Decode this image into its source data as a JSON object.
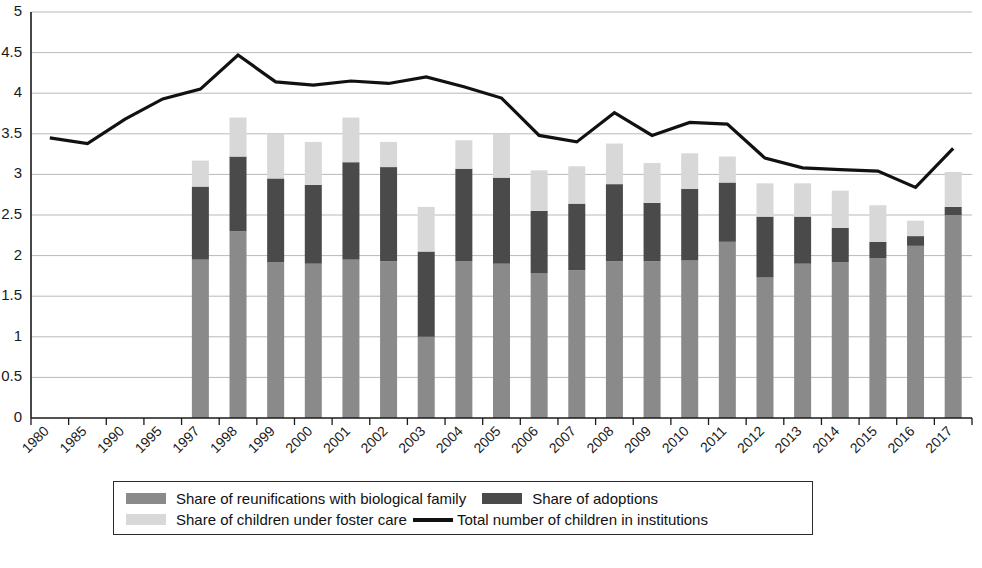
{
  "chart_data": {
    "type": "bar",
    "title": "",
    "subtitle": "",
    "xlabel": "",
    "ylabel": "",
    "ylim": [
      0,
      5
    ],
    "ytick_values": [
      0,
      0.5,
      1,
      1.5,
      2,
      2.5,
      3,
      3.5,
      4,
      4.5,
      5
    ],
    "ytick_labels": [
      "0",
      "0.5",
      "1",
      "1.5",
      "2",
      "2.5",
      "3",
      "3.5",
      "4",
      "4.5",
      "5"
    ],
    "grid": true,
    "stacked": true,
    "legend_position": "bottom",
    "categories": [
      "1980",
      "1985",
      "1990",
      "1995",
      "1997",
      "1998",
      "1999",
      "2000",
      "2001",
      "2002",
      "2003",
      "2004",
      "2005",
      "2006",
      "2007",
      "2008",
      "2009",
      "2010",
      "2011",
      "2012",
      "2013",
      "2014",
      "2015",
      "2016",
      "2017"
    ],
    "series": [
      {
        "name": "Share of reunifications with biological family",
        "color": "#8a8a8a",
        "type": "bar",
        "values": [
          null,
          null,
          null,
          null,
          1.95,
          2.3,
          1.92,
          1.9,
          1.95,
          1.93,
          1.0,
          1.93,
          1.9,
          1.78,
          1.82,
          1.93,
          1.93,
          1.94,
          2.17,
          1.73,
          1.9,
          1.92,
          1.97,
          2.12,
          2.5
        ]
      },
      {
        "name": "Share of adoptions",
        "color": "#4a4a4a",
        "type": "bar",
        "values": [
          null,
          null,
          null,
          null,
          0.9,
          0.92,
          1.03,
          0.97,
          1.2,
          1.16,
          1.05,
          1.14,
          1.06,
          0.77,
          0.82,
          0.95,
          0.72,
          0.88,
          0.73,
          0.75,
          0.58,
          0.42,
          0.2,
          0.12,
          0.1
        ]
      },
      {
        "name": "Share of children under foster care",
        "color": "#d8d8d8",
        "type": "bar",
        "values": [
          null,
          null,
          null,
          null,
          0.32,
          0.48,
          0.55,
          0.53,
          0.55,
          0.31,
          0.55,
          0.35,
          0.54,
          0.5,
          0.46,
          0.5,
          0.49,
          0.44,
          0.32,
          0.41,
          0.41,
          0.46,
          0.45,
          0.19,
          0.43
        ]
      },
      {
        "name": "Total number of children in institutions",
        "color": "#111111",
        "type": "line",
        "values": [
          3.45,
          3.38,
          3.68,
          3.93,
          4.05,
          4.47,
          4.14,
          4.1,
          4.15,
          4.12,
          4.2,
          4.08,
          3.94,
          3.48,
          3.4,
          3.76,
          3.48,
          3.64,
          3.62,
          3.2,
          3.08,
          3.06,
          3.04,
          2.84,
          3.32
        ]
      }
    ]
  },
  "legend": {
    "items": [
      {
        "label": "Share of reunifications with biological family",
        "marker": "swatch",
        "color": "#8a8a8a"
      },
      {
        "label": "Share of adoptions",
        "marker": "swatch",
        "color": "#4a4a4a"
      },
      {
        "label": "Share of children under foster care",
        "marker": "swatch",
        "color": "#d8d8d8"
      },
      {
        "label": "Total number of children in institutions",
        "marker": "line",
        "color": "#111111"
      }
    ]
  }
}
